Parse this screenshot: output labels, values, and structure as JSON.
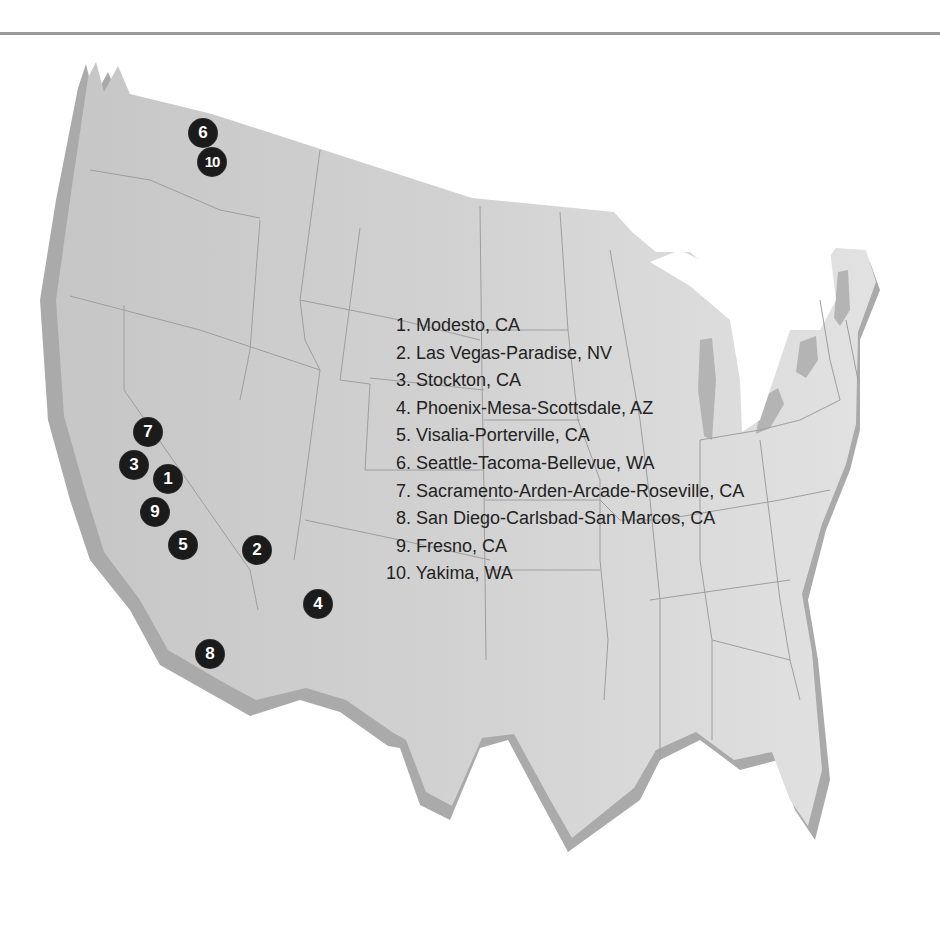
{
  "map": {
    "region": "Continental United States",
    "land_color": "#c9c9c9",
    "land_color_east": "#dcdcdc",
    "shadow_color": "#a9a9a9",
    "border_color": "#9e9e9e",
    "marker_color": "#1b1b1b",
    "marker_text_color": "#ffffff"
  },
  "markers": [
    {
      "rank": "1",
      "x": 168,
      "y": 479
    },
    {
      "rank": "2",
      "x": 257,
      "y": 550
    },
    {
      "rank": "3",
      "x": 134,
      "y": 465
    },
    {
      "rank": "4",
      "x": 318,
      "y": 604
    },
    {
      "rank": "5",
      "x": 183,
      "y": 545
    },
    {
      "rank": "6",
      "x": 203,
      "y": 133
    },
    {
      "rank": "7",
      "x": 148,
      "y": 432
    },
    {
      "rank": "8",
      "x": 210,
      "y": 654
    },
    {
      "rank": "9",
      "x": 155,
      "y": 512
    },
    {
      "rank": "10",
      "x": 212,
      "y": 162
    }
  ],
  "legend": {
    "items": [
      {
        "label": "1. Modesto, CA"
      },
      {
        "label": "2. Las Vegas-Paradise, NV"
      },
      {
        "label": "3. Stockton, CA"
      },
      {
        "label": "4. Phoenix-Mesa-Scottsdale, AZ"
      },
      {
        "label": "5. Visalia-Porterville, CA"
      },
      {
        "label": "6. Seattle-Tacoma-Bellevue, WA"
      },
      {
        "label": "7. Sacramento-Arden-Arcade-Roseville, CA"
      },
      {
        "label": "8. San Diego-Carlsbad-San Marcos, CA"
      },
      {
        "label": "9. Fresno, CA"
      },
      {
        "label": "10. Yakima, WA"
      }
    ]
  }
}
